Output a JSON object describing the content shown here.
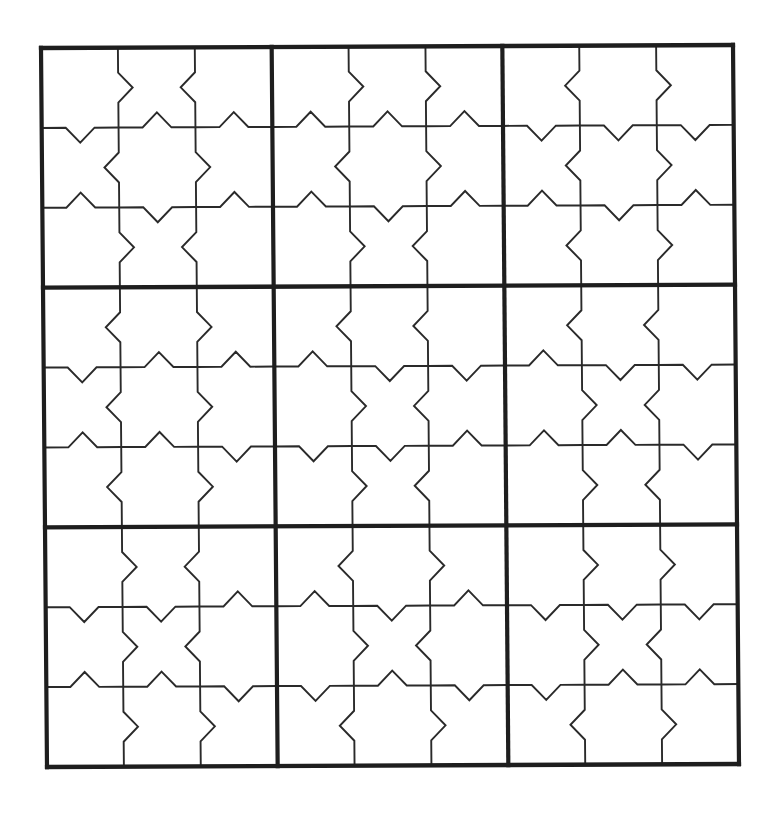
{
  "puzzle": {
    "type": "jigsaw-sudoku-grid",
    "size": 9,
    "box_size": 3,
    "colors": {
      "background": "#ffffff",
      "thin_line": "#2a2a2a",
      "thick_line": "#1e1e1e"
    },
    "stroke": {
      "thin": 1.9,
      "thick": 4.2
    },
    "notch": {
      "half_width": 15,
      "depth": 15
    },
    "placement": {
      "origin": [
        41,
        48
      ],
      "x_axis_end": [
        733,
        45
      ],
      "y_axis_end": [
        47,
        767
      ],
      "units": 720
    },
    "vertical_edges": {
      "1": [
        "R",
        "L",
        "R",
        "L",
        "L",
        "L",
        "R",
        "R",
        "R"
      ],
      "2": [
        "L",
        "R",
        "L",
        "R",
        "R",
        "R",
        "L",
        "L",
        "R"
      ],
      "4": [
        "R",
        "L",
        "R",
        "L",
        "R",
        "R",
        "L",
        "R",
        "L"
      ],
      "5": [
        "R",
        "R",
        "L",
        "L",
        "L",
        "L",
        "R",
        "L",
        "R"
      ],
      "7": [
        "L",
        "L",
        "L",
        "L",
        "R",
        "R",
        "R",
        "R",
        "L"
      ],
      "8": [
        "R",
        "R",
        "R",
        "L",
        "L",
        "L",
        "R",
        "L",
        "R"
      ]
    },
    "horizontal_edges": {
      "1": [
        "D",
        "U",
        "U",
        "U",
        "U",
        "U",
        "D",
        "D",
        "D"
      ],
      "2": [
        "U",
        "D",
        "U",
        "U",
        "D",
        "U",
        "U",
        "D",
        "U"
      ],
      "4": [
        "D",
        "U",
        "U",
        "U",
        "D",
        "D",
        "U",
        "D",
        "D"
      ],
      "5": [
        "U",
        "U",
        "D",
        "D",
        "D",
        "U",
        "U",
        "U",
        "D"
      ],
      "7": [
        "D",
        "D",
        "U",
        "U",
        "D",
        "U",
        "D",
        "D",
        "D"
      ],
      "8": [
        "U",
        "U",
        "D",
        "D",
        "U",
        "D",
        "D",
        "U",
        "U"
      ]
    },
    "cells": [
      [
        "",
        "",
        "",
        "",
        "",
        "",
        "",
        "",
        ""
      ],
      [
        "",
        "",
        "",
        "",
        "",
        "",
        "",
        "",
        ""
      ],
      [
        "",
        "",
        "",
        "",
        "",
        "",
        "",
        "",
        ""
      ],
      [
        "",
        "",
        "",
        "",
        "",
        "",
        "",
        "",
        ""
      ],
      [
        "",
        "",
        "",
        "",
        "",
        "",
        "",
        "",
        ""
      ],
      [
        "",
        "",
        "",
        "",
        "",
        "",
        "",
        "",
        ""
      ],
      [
        "",
        "",
        "",
        "",
        "",
        "",
        "",
        "",
        ""
      ],
      [
        "",
        "",
        "",
        "",
        "",
        "",
        "",
        "",
        ""
      ],
      [
        "",
        "",
        "",
        "",
        "",
        "",
        "",
        "",
        ""
      ]
    ]
  }
}
